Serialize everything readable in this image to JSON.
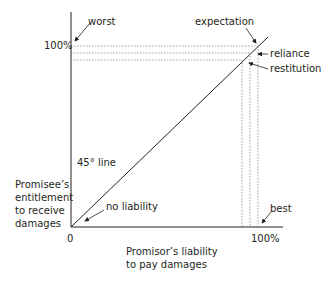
{
  "diagram": {
    "y_axis": {
      "label_lines": [
        "Promisee’s",
        "entitlement",
        "to receive",
        "damages"
      ],
      "tick_top": "100%"
    },
    "x_axis": {
      "label_lines": [
        "Promisor’s liability",
        "to pay damages"
      ],
      "tick_right": "100%",
      "origin": "0"
    },
    "line_label": "45° line",
    "annotations": {
      "worst": "worst",
      "expectation": "expectation",
      "reliance": "reliance",
      "restitution": "restitution",
      "no_liability": "no liability",
      "best": "best"
    },
    "colors": {
      "line": "#231f20",
      "dashed": "#8a8a8a",
      "text": "#231f20"
    }
  }
}
